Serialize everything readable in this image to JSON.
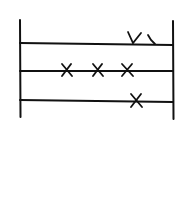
{
  "diagram": {
    "stroke_color": "#111111",
    "background": "#ffffff",
    "rails": [
      {
        "id": "left-rail",
        "x": 20,
        "y1": 20,
        "y2": 117
      },
      {
        "id": "right-rail",
        "x": 173,
        "y1": 21,
        "y2": 119
      }
    ],
    "rows": [
      {
        "id": "row-1",
        "y_left": 43,
        "y_right": 45,
        "marks": [
          {
            "type": "check",
            "x": 135,
            "y": 38
          },
          {
            "type": "tick",
            "x": 152,
            "y": 39
          }
        ]
      },
      {
        "id": "row-2",
        "y_left": 71,
        "y_right": 71,
        "marks": [
          {
            "type": "x",
            "x": 67,
            "y": 70
          },
          {
            "type": "x",
            "x": 98,
            "y": 70
          },
          {
            "type": "x",
            "x": 127,
            "y": 70
          }
        ]
      },
      {
        "id": "row-3",
        "y_left": 100,
        "y_right": 102,
        "marks": [
          {
            "type": "x",
            "x": 136,
            "y": 101
          }
        ]
      }
    ]
  }
}
